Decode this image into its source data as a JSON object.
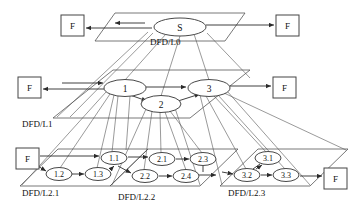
{
  "diagram": {
    "colors": {
      "stroke": "#333333",
      "plane_stroke": "#555555",
      "text": "#111111",
      "background": "#ffffff"
    },
    "levels": [
      {
        "id": "L0",
        "label": "DFD/L0",
        "label_x": 150,
        "label_y": 45,
        "plane": "115,13 245,13 225,41 95,41"
      },
      {
        "id": "L1",
        "label": "DFD/L1",
        "label_x": 22,
        "label_y": 127,
        "plane": "113,70 250,70 190,118 53,118"
      },
      {
        "id": "L2.1",
        "label": "DFD/L2.1",
        "label_x": 22,
        "label_y": 196,
        "plane": "58,149 148,149 110,186 20,186"
      },
      {
        "id": "L2.2",
        "label": "DFD/L2.2",
        "label_x": 118,
        "label_y": 200,
        "plane": "148,149 238,149 200,186 110,186"
      },
      {
        "id": "L2.3",
        "label": "DFD/L2.3",
        "label_x": 228,
        "label_y": 196,
        "plane": "258,149 348,149 310,186 220,186"
      }
    ],
    "processes": [
      {
        "id": "S",
        "label": "S",
        "cx": 180,
        "cy": 27,
        "rx": 26,
        "ry": 9,
        "size": "big"
      },
      {
        "id": "P1",
        "label": "1",
        "cx": 125,
        "cy": 88,
        "rx": 21,
        "ry": 8.5,
        "size": "big"
      },
      {
        "id": "P2",
        "label": "2",
        "cx": 161,
        "cy": 104,
        "rx": 20,
        "ry": 8.5,
        "size": "big"
      },
      {
        "id": "P3",
        "label": "3",
        "cx": 209,
        "cy": 88,
        "rx": 21,
        "ry": 8.5,
        "size": "big"
      },
      {
        "id": "P11",
        "label": "1.1",
        "cx": 114,
        "cy": 158,
        "rx": 13,
        "ry": 6.5,
        "size": "small"
      },
      {
        "id": "P12",
        "label": "1.2",
        "cx": 59,
        "cy": 174,
        "rx": 13,
        "ry": 6.5,
        "size": "small"
      },
      {
        "id": "P13",
        "label": "1.3",
        "cx": 98,
        "cy": 174,
        "rx": 13,
        "ry": 6.5,
        "size": "small"
      },
      {
        "id": "P21",
        "label": "2.1",
        "cx": 162,
        "cy": 159,
        "rx": 13,
        "ry": 6.5,
        "size": "small"
      },
      {
        "id": "P22",
        "label": "2.2",
        "cx": 145,
        "cy": 176,
        "rx": 13,
        "ry": 6.5,
        "size": "small"
      },
      {
        "id": "P23",
        "label": "2.3",
        "cx": 203,
        "cy": 159,
        "rx": 13,
        "ry": 6.5,
        "size": "small"
      },
      {
        "id": "P24",
        "label": "2.4",
        "cx": 186,
        "cy": 176,
        "rx": 13,
        "ry": 6.5,
        "size": "small"
      },
      {
        "id": "P31",
        "label": "3.1",
        "cx": 268,
        "cy": 158,
        "rx": 13,
        "ry": 6.5,
        "size": "small"
      },
      {
        "id": "P32",
        "label": "3.2",
        "cx": 247,
        "cy": 175,
        "rx": 13,
        "ry": 6.5,
        "size": "small"
      },
      {
        "id": "P33",
        "label": "3.3",
        "cx": 286,
        "cy": 175,
        "rx": 13,
        "ry": 6.5,
        "size": "small"
      }
    ],
    "externals": [
      {
        "id": "F-L0-left",
        "label": "F",
        "x": 61,
        "y": 15,
        "w": 23,
        "h": 21
      },
      {
        "id": "F-L0-right",
        "label": "F",
        "x": 276,
        "y": 15,
        "w": 23,
        "h": 21
      },
      {
        "id": "F-L1-left",
        "label": "F",
        "x": 18,
        "y": 77,
        "w": 23,
        "h": 21
      },
      {
        "id": "F-L1-right",
        "label": "F",
        "x": 273,
        "y": 77,
        "w": 23,
        "h": 21
      },
      {
        "id": "F-L21-left",
        "label": "F",
        "x": 16,
        "y": 148,
        "w": 23,
        "h": 21
      },
      {
        "id": "F-L23-right",
        "label": "F",
        "x": 324,
        "y": 168,
        "w": 23,
        "h": 21
      }
    ],
    "flows": [
      {
        "from": "S",
        "to": "F-L0-left",
        "kind": "external"
      },
      {
        "from": "S",
        "to": "F-L0-right",
        "kind": "external"
      },
      {
        "from": "F-L1-left",
        "to": "P1",
        "kind": "external"
      },
      {
        "from": "P1",
        "to": "F-L1-left",
        "kind": "external"
      },
      {
        "from": "P1",
        "to": "P3",
        "kind": "internal"
      },
      {
        "from": "P1",
        "to": "P2",
        "kind": "internal"
      },
      {
        "from": "P2",
        "to": "P3",
        "kind": "internal"
      },
      {
        "from": "P3",
        "to": "F-L1-right",
        "kind": "external"
      },
      {
        "from": "F-L21-left",
        "to": "P11",
        "kind": "external"
      },
      {
        "from": "F-L21-left",
        "to": "P12",
        "kind": "external"
      },
      {
        "from": "P12",
        "to": "P13",
        "kind": "internal"
      },
      {
        "from": "P13",
        "to": "P11",
        "kind": "internal"
      },
      {
        "from": "P11",
        "to": "P21",
        "kind": "internal"
      },
      {
        "from": "P11",
        "to": "P22",
        "kind": "internal"
      },
      {
        "from": "P22",
        "to": "P24",
        "kind": "internal"
      },
      {
        "from": "P21",
        "to": "P23",
        "kind": "internal"
      },
      {
        "from": "P24",
        "to": "P23",
        "kind": "internal"
      },
      {
        "from": "P23",
        "to": "P32",
        "kind": "internal"
      },
      {
        "from": "P32",
        "to": "P31",
        "kind": "internal"
      },
      {
        "from": "P32",
        "to": "P33",
        "kind": "internal"
      },
      {
        "from": "P33",
        "to": "F-L23-right",
        "kind": "external"
      }
    ],
    "decompositions": [
      {
        "parent": "S",
        "child": "P1"
      },
      {
        "parent": "S",
        "child": "P2"
      },
      {
        "parent": "S",
        "child": "P3"
      },
      {
        "parent": "P1",
        "child": "P11"
      },
      {
        "parent": "P1",
        "child": "P12"
      },
      {
        "parent": "P1",
        "child": "P13"
      },
      {
        "parent": "P2",
        "child": "P21"
      },
      {
        "parent": "P2",
        "child": "P22"
      },
      {
        "parent": "P2",
        "child": "P23"
      },
      {
        "parent": "P2",
        "child": "P24"
      },
      {
        "parent": "P3",
        "child": "P31"
      },
      {
        "parent": "P3",
        "child": "P32"
      },
      {
        "parent": "P3",
        "child": "P33"
      }
    ]
  }
}
